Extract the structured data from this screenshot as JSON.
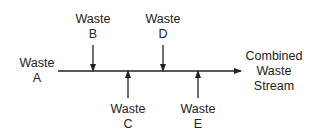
{
  "diagram": {
    "main_stream": {
      "from": "Waste A",
      "to": "Combined Waste Stream"
    },
    "inputs": [
      {
        "id": "A",
        "line1": "Waste",
        "line2": "A",
        "direction": "start"
      },
      {
        "id": "B",
        "line1": "Waste",
        "line2": "B",
        "direction": "down"
      },
      {
        "id": "C",
        "line1": "Waste",
        "line2": "C",
        "direction": "up"
      },
      {
        "id": "D",
        "line1": "Waste",
        "line2": "D",
        "direction": "down"
      },
      {
        "id": "E",
        "line1": "Waste",
        "line2": "E",
        "direction": "up"
      }
    ],
    "output": {
      "line1": "Combined",
      "line2": "Waste",
      "line3": "Stream"
    },
    "colors": {
      "line": "#222222",
      "text": "#222222"
    }
  }
}
